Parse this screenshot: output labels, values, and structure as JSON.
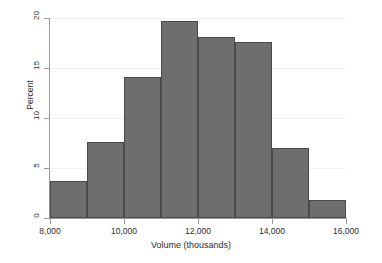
{
  "chart_data": {
    "type": "bar",
    "title": "",
    "xlabel": "Volume (thousands)",
    "ylabel": "Percent",
    "grid": true,
    "legend": "none",
    "xlim": [
      8000,
      16000
    ],
    "ylim": [
      0,
      20
    ],
    "bin_width": 1000,
    "categories": [
      "8,000-9,000",
      "9,000-10,000",
      "10,000-11,000",
      "11,000-12,000",
      "12,000-13,000",
      "13,000-14,000",
      "14,000-15,000",
      "15,000-16,000"
    ],
    "bin_edges": [
      8000,
      9000,
      10000,
      11000,
      12000,
      13000,
      14000,
      15000,
      16000
    ],
    "values": [
      3.7,
      7.6,
      14.1,
      19.7,
      18.1,
      17.6,
      7.0,
      1.8
    ],
    "x_ticks": [
      8000,
      10000,
      12000,
      14000,
      16000
    ],
    "x_tick_labels": [
      "8,000",
      "10,000",
      "12,000",
      "14,000",
      "16,000"
    ],
    "y_ticks": [
      0,
      5,
      10,
      15,
      20
    ],
    "y_tick_labels": [
      "0",
      "5",
      "10",
      "15",
      "20"
    ],
    "bar_fill_color": "#6e6e6e",
    "bar_border_color": "#4a4a4a",
    "axis_color": "#9a9a9a",
    "gridline_color": "#f2f2f2",
    "background_color": "#ffffff"
  }
}
